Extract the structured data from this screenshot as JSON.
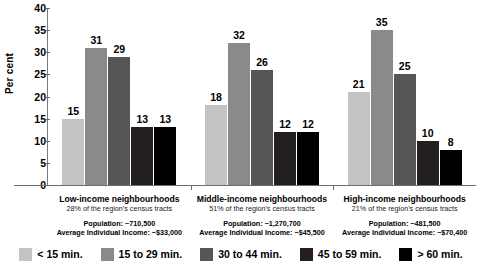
{
  "chart_data": {
    "type": "bar",
    "title": "",
    "xlabel": "",
    "ylabel": "Per cent",
    "ylim": [
      0,
      40
    ],
    "yticks": [
      40,
      35,
      30,
      25,
      20,
      15,
      10,
      5,
      0
    ],
    "grid": false,
    "legend_position": "bottom",
    "categories": [
      "Low-income neighbourhoods",
      "Middle-income neighbourhoods",
      "High-income neighbourhoods"
    ],
    "series": [
      {
        "name": "< 15 min.",
        "color": "#c3c3c3",
        "values": [
          15,
          18,
          21
        ]
      },
      {
        "name": "15 to 29 min.",
        "color": "#8a8a8a",
        "values": [
          31,
          32,
          35
        ]
      },
      {
        "name": "30 to 44 min.",
        "color": "#565656",
        "values": [
          29,
          26,
          25
        ]
      },
      {
        "name": "45 to 59 min.",
        "color": "#231f1f",
        "values": [
          13,
          12,
          10
        ]
      },
      {
        "name": "> 60 min.",
        "color": "#000000",
        "values": [
          13,
          12,
          8
        ]
      }
    ]
  },
  "axis": {
    "y_label": "Per cent",
    "y_ticks": [
      "40",
      "35",
      "30",
      "25",
      "20",
      "15",
      "10",
      "5",
      "0"
    ]
  },
  "groups": [
    {
      "title": "Low-income neighbourhoods",
      "subtitle": "28% of the region's census tracts",
      "population": "Population: ~710,500",
      "income": "Average Individual Income: ~$33,000",
      "values": [
        "15",
        "31",
        "29",
        "13",
        "13"
      ]
    },
    {
      "title": "Middle-income neighbourhoods",
      "subtitle": "51% of the region's census tracts",
      "population": "Population: ~1,270,700",
      "income": "Average Individual Income: ~$45,500",
      "values": [
        "18",
        "32",
        "26",
        "12",
        "12"
      ]
    },
    {
      "title": "High-income neighbourhoods",
      "subtitle": "21% of the region's census tracts",
      "population": "Population: ~481,500",
      "income": "Average Individual Income: ~$70,400",
      "values": [
        "21",
        "35",
        "25",
        "10",
        "8"
      ]
    }
  ],
  "legend": {
    "items": [
      {
        "label": "< 15 min.",
        "color": "#c3c3c3"
      },
      {
        "label": "15 to 29 min.",
        "color": "#8a8a8a"
      },
      {
        "label": "30 to 44 min.",
        "color": "#565656"
      },
      {
        "label": "45 to 59 min.",
        "color": "#231f1f"
      },
      {
        "label": "> 60 min.",
        "color": "#000000"
      }
    ]
  }
}
